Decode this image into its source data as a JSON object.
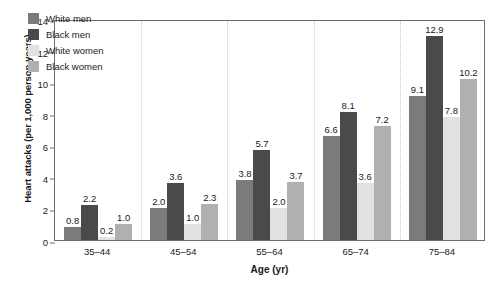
{
  "chart_data": {
    "type": "bar",
    "title": "",
    "xlabel": "Age (yr)",
    "ylabel": "Heart attacks (per 1,000 person-years)",
    "categories": [
      "35–44",
      "45–54",
      "55–64",
      "65–74",
      "75–84"
    ],
    "ylim": [
      0,
      14
    ],
    "yticks": [
      0,
      2,
      4,
      6,
      8,
      10,
      12,
      14
    ],
    "ytick_labels": [
      "0",
      "2",
      "4",
      "6",
      "8",
      "10",
      "12",
      "14"
    ],
    "grid": false,
    "group_separators": true,
    "legend_position": "upper-left-inside",
    "series": [
      {
        "name": "White men",
        "color": "#7b7b7b",
        "values": [
          0.8,
          2.0,
          3.8,
          6.6,
          9.1
        ],
        "labels": [
          "0.8",
          "2.0",
          "3.8",
          "6.6",
          "9.1"
        ]
      },
      {
        "name": "Black men",
        "color": "#4a4a4a",
        "values": [
          2.2,
          3.6,
          5.7,
          8.1,
          12.9
        ],
        "labels": [
          "2.2",
          "3.6",
          "5.7",
          "8.1",
          "12.9"
        ]
      },
      {
        "name": "White women",
        "color": "#e2e2e2",
        "values": [
          0.2,
          1.0,
          2.0,
          3.6,
          7.8
        ],
        "labels": [
          "0.2",
          "1.0",
          "2.0",
          "3.6",
          "7.8"
        ]
      },
      {
        "name": "Black women",
        "color": "#b0b0b0",
        "values": [
          1.0,
          2.3,
          3.7,
          7.2,
          10.2
        ],
        "labels": [
          "1.0",
          "2.3",
          "3.7",
          "7.2",
          "10.2"
        ]
      }
    ]
  }
}
